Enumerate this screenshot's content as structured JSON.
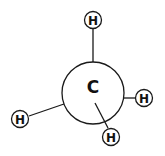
{
  "diagram": {
    "type": "newman-projection",
    "central_atom": {
      "label": "C"
    },
    "substituents": [
      {
        "label": "H",
        "position": "top",
        "bond": "front"
      },
      {
        "label": "H",
        "position": "right",
        "bond": "back"
      },
      {
        "label": "H",
        "position": "lower-left",
        "bond": "back"
      },
      {
        "label": "H",
        "position": "lower-right",
        "bond": "front"
      }
    ],
    "colors": {
      "stroke": "#1a1a1a",
      "text": "#111111",
      "background": "#ffffff"
    }
  }
}
